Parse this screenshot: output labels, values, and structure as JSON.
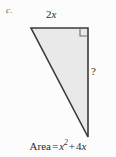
{
  "figure": {
    "part_label": "c.",
    "shape": "right-triangle",
    "fill_color": "#e9e9e9",
    "stroke_color": "#3a3a3a",
    "background_color": "#fcfcfc",
    "vertices": {
      "top_left": [
        31,
        28
      ],
      "top_right": [
        88,
        28
      ],
      "bottom": [
        88,
        137
      ]
    },
    "right_angle_marker": {
      "at_vertex": "top_right",
      "size": 8
    },
    "labels": {
      "top_side": {
        "coefficient": "2",
        "variable": "x"
      },
      "right_side": "?"
    },
    "caption": {
      "name": "Area",
      "equals": "=",
      "term1_base": "x",
      "term1_exponent": "2",
      "plus": "+",
      "term2": "4",
      "term2_variable": "x"
    }
  }
}
